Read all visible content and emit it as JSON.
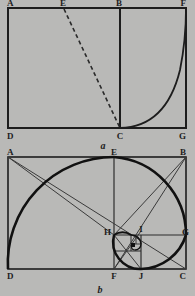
{
  "page": {
    "background_color": "#b9b9b7",
    "ink_color": "#1d1d1d",
    "thin_color": "#3a3a3a",
    "width": 195,
    "height": 296
  },
  "figure_a": {
    "caption": "a",
    "outer_rect": {
      "x": 8,
      "y": 8,
      "width": 178,
      "height": 120
    },
    "vertices": [
      {
        "name": "A",
        "label": "A",
        "x": 8,
        "y": 8,
        "label_x": 7,
        "label_y": 6
      },
      {
        "name": "E",
        "label": "E",
        "x": 64,
        "y": 8,
        "label_x": 63,
        "label_y": 6
      },
      {
        "name": "B",
        "label": "B",
        "x": 120,
        "y": 8,
        "label_x": 119,
        "label_y": 6
      },
      {
        "name": "F",
        "label": "F",
        "x": 186,
        "y": 8,
        "label_x": 184,
        "label_y": 6
      },
      {
        "name": "D",
        "label": "D",
        "x": 8,
        "y": 128,
        "label_x": 7,
        "label_y": 137
      },
      {
        "name": "C",
        "label": "C",
        "x": 120,
        "y": 128,
        "label_x": 119,
        "label_y": 137
      },
      {
        "name": "G",
        "label": "G",
        "x": 186,
        "y": 128,
        "label_x": 184,
        "label_y": 137
      }
    ],
    "segments": [
      {
        "name": "segment-BC",
        "from": "B",
        "to": "C",
        "style": "solid"
      },
      {
        "name": "segment-EC",
        "from": "E",
        "to": "C",
        "style": "dashed"
      }
    ],
    "arc": {
      "name": "arc-CF",
      "from": "C",
      "to": "F",
      "center": "B",
      "note": "quarter arc swung from C up to F"
    }
  },
  "figure_b": {
    "caption": "b",
    "outer_rect": {
      "x": 8,
      "y": 12,
      "width": 178,
      "height": 112
    },
    "vertices": [
      {
        "name": "A",
        "label": "A",
        "x": 8,
        "y": 12,
        "label_x": 7,
        "label_y": 10
      },
      {
        "name": "E",
        "label": "E",
        "x": 114,
        "y": 12,
        "label_x": 113,
        "label_y": 10
      },
      {
        "name": "B",
        "label": "B",
        "x": 186,
        "y": 12,
        "label_x": 184,
        "label_y": 10
      },
      {
        "name": "H",
        "label": "H",
        "x": 114,
        "y": 90,
        "label_x": 109,
        "label_y": 89
      },
      {
        "name": "I",
        "label": "I",
        "x": 141,
        "y": 87,
        "label_x": 140,
        "label_y": 84
      },
      {
        "name": "G",
        "label": "G",
        "x": 186,
        "y": 90,
        "label_x": 184,
        "label_y": 89
      },
      {
        "name": "D",
        "label": "D",
        "x": 8,
        "y": 124,
        "label_x": 7,
        "label_y": 133
      },
      {
        "name": "F",
        "label": "F",
        "x": 114,
        "y": 124,
        "label_x": 113,
        "label_y": 133
      },
      {
        "name": "J",
        "label": "J",
        "x": 141,
        "y": 124,
        "label_x": 140,
        "label_y": 133
      },
      {
        "name": "C",
        "label": "C",
        "x": 186,
        "y": 124,
        "label_x": 184,
        "label_y": 133
      }
    ],
    "squares": [
      {
        "name": "square-AEFD",
        "x": 8,
        "y": 12,
        "size": 106
      },
      {
        "name": "square-EBGH",
        "x": 114,
        "y": 12,
        "size": 78
      },
      {
        "name": "square-HIJF",
        "x": 114,
        "y": 90,
        "size": 27
      }
    ],
    "diagonals": [
      {
        "name": "diagonal-AC",
        "from": "A",
        "to": "C"
      },
      {
        "name": "diagonal-BF",
        "from": "B",
        "to": "F"
      },
      {
        "name": "diagonal-AF-region",
        "from": "A",
        "to": "H"
      },
      {
        "name": "diagonal-HB",
        "from": "H",
        "to": "B"
      }
    ],
    "spiral": {
      "name": "golden-spiral",
      "note": "quarter-circle arcs of decreasing radius, spiralling inward to the eye near I"
    }
  }
}
